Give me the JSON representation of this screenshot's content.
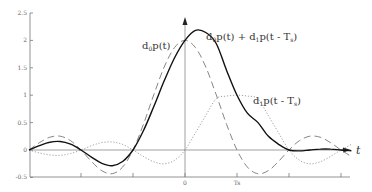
{
  "chart_data": {
    "type": "line",
    "title": "",
    "xlabel": "t",
    "ylabel": "",
    "ylim": [
      -0.5,
      2.5
    ],
    "xlim_in_Ts": [
      -3.0,
      3.2
    ],
    "grid": false,
    "legend": "inline annotations",
    "y_ticks": [
      "2.5",
      "2",
      "1.5",
      "1",
      "0.5",
      "0",
      "-0.5"
    ],
    "y_tick_values": [
      2.5,
      2,
      1.5,
      1,
      0.5,
      0,
      -0.5
    ],
    "x_ticks": [
      "",
      "",
      "0",
      "Ts",
      "",
      ""
    ],
    "x_tick_values_in_Ts": [
      -2,
      -1,
      0,
      1,
      2,
      3
    ],
    "x_in_Ts": [
      -3.0,
      -2.8,
      -2.6,
      -2.4,
      -2.2,
      -2.0,
      -1.8,
      -1.6,
      -1.4,
      -1.2,
      -1.0,
      -0.8,
      -0.6,
      -0.4,
      -0.2,
      0.0,
      0.2,
      0.4,
      0.6,
      0.8,
      1.0,
      1.2,
      1.4,
      1.6,
      1.8,
      2.0,
      2.2,
      2.4,
      2.6,
      2.8,
      3.0,
      3.2
    ],
    "series": [
      {
        "name": "d0p(t)",
        "style": "dashed",
        "values": [
          0.0,
          0.134,
          0.233,
          0.252,
          0.17,
          0.0,
          -0.208,
          -0.378,
          -0.432,
          -0.312,
          0.0,
          0.468,
          1.009,
          1.514,
          1.871,
          2.0,
          1.871,
          1.514,
          1.009,
          0.468,
          0.0,
          -0.312,
          -0.432,
          -0.378,
          -0.208,
          0.0,
          0.17,
          0.252,
          0.233,
          0.134,
          0.0,
          -0.118
        ]
      },
      {
        "name": "d1p(t - Ts)",
        "style": "dotted",
        "values": [
          0.0,
          -0.053,
          -0.09,
          -0.097,
          -0.064,
          0.0,
          0.078,
          0.135,
          0.146,
          0.102,
          0.0,
          -0.117,
          -0.216,
          -0.252,
          -0.187,
          0.0,
          0.312,
          0.631,
          0.935,
          0.984,
          1.0,
          0.984,
          0.935,
          0.631,
          0.312,
          0.0,
          -0.187,
          -0.252,
          -0.216,
          -0.117,
          0.0,
          0.104
        ]
      },
      {
        "name": "d0p(t) + d1p(t - Ts)",
        "style": "solid",
        "values": [
          0.0,
          0.081,
          0.143,
          0.155,
          0.106,
          0.0,
          -0.13,
          -0.243,
          -0.286,
          -0.21,
          0.0,
          0.351,
          0.793,
          1.262,
          1.684,
          2.0,
          2.183,
          2.145,
          1.944,
          1.452,
          1.0,
          0.672,
          0.503,
          0.253,
          0.104,
          0.0,
          -0.017,
          0.0,
          0.017,
          0.017,
          0.0,
          -0.014
        ]
      }
    ],
    "annotations": [
      {
        "text": "d0p(t)",
        "near_x_Ts": -0.6,
        "near_y": 2.05
      },
      {
        "text": "d0p(t) + d1p(t - Ts)",
        "near_x_Ts": 0.4,
        "near_y": 2.05
      },
      {
        "text": "d1p(t - Ts)",
        "near_x_Ts": 1.7,
        "near_y": 0.8
      }
    ]
  },
  "labels": {
    "ann_d0_main": "d",
    "ann_d0_sub": "0",
    "ann_d0_rest": "p(t)",
    "ann_sum_a": "d",
    "ann_sum_a_sub": "0",
    "ann_sum_b": "p(t) + d",
    "ann_sum_b_sub": "1",
    "ann_sum_c": "p(t - T",
    "ann_sum_c_sub": "s",
    "ann_sum_d": ")",
    "ann_d1_main": "d",
    "ann_d1_sub": "1",
    "ann_d1_rest": "p(t - T",
    "ann_d1_sub2": "s",
    "ann_d1_end": ")",
    "t_axis": "t"
  }
}
